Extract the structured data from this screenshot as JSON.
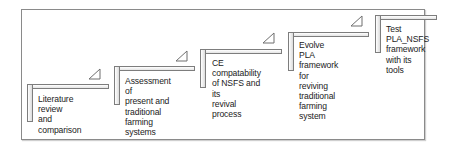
{
  "diagram": {
    "type": "staircase-process",
    "steps": [
      {
        "index": 1,
        "label": "Literature review\nand comparison"
      },
      {
        "index": 2,
        "label": "Assessment of\npresent and\ntraditional farming\nsystems"
      },
      {
        "index": 3,
        "label": "CE compatability\nof NSFS and its\nrevival process"
      },
      {
        "index": 4,
        "label": "Evolve PLA\nframework for\nreviving traditional\nfarming system"
      },
      {
        "index": 5,
        "label": "Test PLA_NSFS\nframework\nwith its tools"
      }
    ],
    "colors": {
      "border": "#7d7d7d",
      "frame": "#8a8a8a",
      "text": "#222222",
      "fill": "#e4e4e4"
    }
  }
}
